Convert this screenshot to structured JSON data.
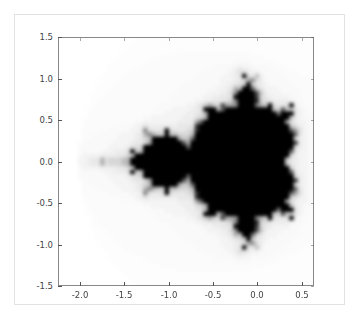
{
  "figure": {
    "background_color": "#ffffff",
    "border_color": "#e2e2e2",
    "axes_edge_color": "#888888",
    "tick_color": "#555555",
    "tick_label_color": "#444444"
  },
  "chart_data": {
    "type": "heatmap",
    "title": "",
    "subtitle": "",
    "xlabel": "",
    "ylabel": "",
    "colormap": "gray_r",
    "grid": false,
    "legend": null,
    "colorbar": false,
    "interpolation": "bilinear",
    "xlim": [
      -2.25,
      0.64
    ],
    "ylim": [
      -1.5,
      1.5
    ],
    "xticks": [
      -2.0,
      -1.5,
      -1.0,
      -0.5,
      0.0,
      0.5
    ],
    "xticklabels": [
      "-2.0",
      "-1.5",
      "-1.0",
      "-0.5",
      "0.0",
      "0.5"
    ],
    "yticks": [
      -1.5,
      -1.0,
      -0.5,
      0.0,
      0.5,
      1.0,
      1.5
    ],
    "yticklabels": [
      "-1.5",
      "-1.0",
      "-0.5",
      "0.0",
      "0.5",
      "1.0",
      "1.5"
    ],
    "value_range": [
      0,
      1
    ],
    "grid_resolution": [
      60,
      60
    ],
    "max_iterations": 20,
    "escape_radius": 2,
    "features": {
      "main_cardioid_center": [
        -0.15,
        0.0
      ],
      "main_cardioid_extent_x": [
        -0.72,
        0.38
      ],
      "period2_bulb_center": [
        -1.0,
        0.0
      ],
      "period2_bulb_radius": 0.25,
      "antenna_extent_x": [
        -2.0,
        -1.25
      ],
      "upper_bulb_center": [
        -0.12,
        0.78
      ],
      "lower_bulb_center": [
        -0.12,
        -0.78
      ]
    }
  }
}
